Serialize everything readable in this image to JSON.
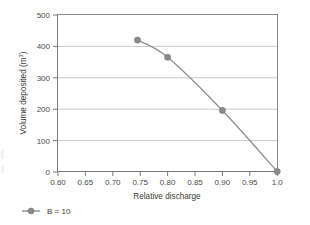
{
  "chart_data": {
    "type": "line",
    "title": "",
    "xlabel": "Relative discharge",
    "ylabel": "Volume deposited (m³)",
    "ylabel_base": "Volume deposited (m",
    "ylabel_sup": "3",
    "ylabel_close": ")",
    "xlim": [
      0.6,
      1.0
    ],
    "ylim": [
      0,
      500
    ],
    "grid": "horizontal",
    "legend_position": "bottom-left",
    "x": [
      0.745,
      0.8,
      0.9,
      1.0
    ],
    "series": [
      {
        "name": "B = 10",
        "values": [
          420,
          365,
          195,
          0
        ],
        "marker": "filled-circle",
        "color": "#8a8a8a"
      }
    ],
    "xticks": [
      0.6,
      0.65,
      0.7,
      0.75,
      0.8,
      0.85,
      0.9,
      0.95,
      1.0
    ],
    "xticklabels": [
      "0.60",
      "0.65",
      "0.70",
      "0.75",
      "0.80",
      "0.85",
      "0.90",
      "0.95",
      "1.0"
    ],
    "yticks": [
      0,
      100,
      200,
      300,
      400,
      500
    ],
    "yticklabels": [
      "0",
      "100",
      "200",
      "300",
      "400",
      "500"
    ]
  },
  "legend": {
    "entries": [
      {
        "label": "B = 10",
        "color": "#8a8a8a",
        "marker": "filled-circle"
      }
    ]
  },
  "colors": {
    "series": "#8a8a8a",
    "grid": "#c9c9c9",
    "axis": "#7a7a7a",
    "frame": "#8a8a8a",
    "text": "#3a3a3a",
    "background": "#ffffff"
  }
}
